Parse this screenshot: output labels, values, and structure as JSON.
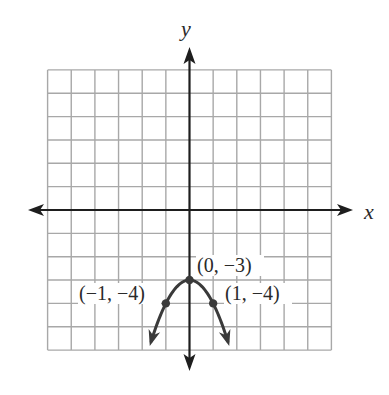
{
  "chart_data": {
    "type": "line",
    "title": "",
    "xlabel": "x",
    "ylabel": "y",
    "xlim": [
      -6,
      6
    ],
    "ylim": [
      -6,
      6
    ],
    "grid": true,
    "grid_step": 1,
    "legend": null,
    "series": [
      {
        "name": "parabola",
        "equation": "y = -x^2 - 3",
        "color": "#3a3a3a",
        "arrows_at_ends": true,
        "x_range": [
          -1.62,
          1.62
        ]
      }
    ],
    "points": [
      {
        "x": -1,
        "y": -4,
        "label": "(−1, −4)"
      },
      {
        "x": 0,
        "y": -3,
        "label": "(0, −3)"
      },
      {
        "x": 1,
        "y": -4,
        "label": "(1, −4)"
      }
    ],
    "annotations": [
      "(−1, −4)",
      "(0, −3)",
      "(1, −4)"
    ]
  },
  "labels": {
    "x_axis": "x",
    "y_axis": "y",
    "vertex": "(0, −3)",
    "left_point": "(−1, −4)",
    "right_point": "(1, −4)"
  },
  "colors": {
    "grid": "#a8a8a8",
    "axis": "#1e1e1e",
    "curve": "#3a3a3a",
    "text": "#2a2a2a"
  }
}
